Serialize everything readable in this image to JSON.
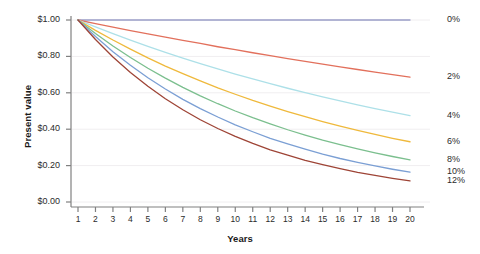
{
  "chart_data": {
    "type": "line",
    "title": "",
    "xlabel": "Years",
    "ylabel": "Present value",
    "xlim": [
      1,
      20
    ],
    "ylim": [
      0,
      1
    ],
    "grid": true,
    "legend_position": "right-inline",
    "x": [
      1,
      2,
      3,
      4,
      5,
      6,
      7,
      8,
      9,
      10,
      11,
      12,
      13,
      14,
      15,
      16,
      17,
      18,
      19,
      20
    ],
    "x_tick_labels": [
      "1",
      "2",
      "3",
      "4",
      "5",
      "6",
      "7",
      "8",
      "9",
      "10",
      "11",
      "12",
      "13",
      "14",
      "15",
      "16",
      "17",
      "18",
      "19",
      "20"
    ],
    "y_tick_values": [
      0.0,
      0.2,
      0.4,
      0.6,
      0.8,
      1.0
    ],
    "y_tick_labels": [
      "$0.00",
      "$0.20",
      "$0.40",
      "$0.60",
      "$0.80",
      "$1.00"
    ],
    "series": [
      {
        "name": "0%",
        "rate": 0.0,
        "color": "#9a9ec8",
        "label": "0%",
        "values": [
          1.0,
          1.0,
          1.0,
          1.0,
          1.0,
          1.0,
          1.0,
          1.0,
          1.0,
          1.0,
          1.0,
          1.0,
          1.0,
          1.0,
          1.0,
          1.0,
          1.0,
          1.0,
          1.0,
          1.0
        ]
      },
      {
        "name": "2%",
        "rate": 0.02,
        "color": "#e2705c",
        "label": "2%",
        "values": [
          1.0,
          0.98,
          0.961,
          0.942,
          0.924,
          0.906,
          0.888,
          0.871,
          0.853,
          0.837,
          0.82,
          0.804,
          0.788,
          0.773,
          0.758,
          0.743,
          0.728,
          0.714,
          0.7,
          0.686
        ]
      },
      {
        "name": "4%",
        "rate": 0.04,
        "color": "#ade0e8",
        "label": "4%",
        "values": [
          1.0,
          0.962,
          0.925,
          0.889,
          0.855,
          0.822,
          0.79,
          0.76,
          0.731,
          0.703,
          0.676,
          0.65,
          0.625,
          0.601,
          0.577,
          0.555,
          0.534,
          0.513,
          0.494,
          0.475
        ]
      },
      {
        "name": "6%",
        "rate": 0.06,
        "color": "#efb93c",
        "label": "6%",
        "values": [
          1.0,
          0.943,
          0.89,
          0.84,
          0.792,
          0.747,
          0.705,
          0.665,
          0.627,
          0.592,
          0.558,
          0.527,
          0.497,
          0.469,
          0.442,
          0.417,
          0.394,
          0.371,
          0.35,
          0.331
        ]
      },
      {
        "name": "8%",
        "rate": 0.08,
        "color": "#7bbf8e",
        "label": "8%",
        "values": [
          1.0,
          0.926,
          0.857,
          0.794,
          0.735,
          0.681,
          0.63,
          0.583,
          0.54,
          0.5,
          0.463,
          0.429,
          0.397,
          0.368,
          0.34,
          0.315,
          0.292,
          0.27,
          0.25,
          0.232
        ]
      },
      {
        "name": "10%",
        "rate": 0.1,
        "color": "#7b9fd4",
        "label": "10%",
        "values": [
          1.0,
          0.909,
          0.826,
          0.751,
          0.683,
          0.621,
          0.564,
          0.513,
          0.467,
          0.424,
          0.386,
          0.35,
          0.319,
          0.29,
          0.263,
          0.239,
          0.218,
          0.198,
          0.18,
          0.164
        ]
      },
      {
        "name": "12%",
        "rate": 0.12,
        "color": "#9e4436",
        "label": "12%",
        "values": [
          1.0,
          0.893,
          0.797,
          0.712,
          0.636,
          0.567,
          0.507,
          0.452,
          0.404,
          0.361,
          0.322,
          0.287,
          0.257,
          0.229,
          0.205,
          0.183,
          0.163,
          0.146,
          0.13,
          0.116
        ]
      }
    ]
  },
  "axes": {
    "axis_color": "#808080",
    "grid_color": "#f0eef0",
    "background": "#ffffff"
  }
}
